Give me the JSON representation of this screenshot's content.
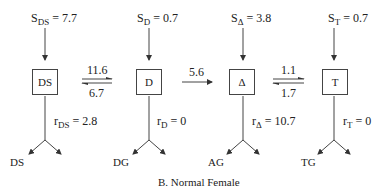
{
  "caption": "B. Normal Female",
  "compartments": [
    {
      "id": "DS",
      "label": "DS",
      "source": {
        "symbol": "S",
        "subscript": "DS",
        "value": "= 7.7"
      },
      "removal": {
        "symbol": "r",
        "subscript": "DS",
        "value": "= 2.8"
      },
      "output": "DS"
    },
    {
      "id": "D",
      "label": "D",
      "source": {
        "symbol": "S",
        "subscript": "D",
        "value": "= 0.7"
      },
      "removal": {
        "symbol": "r",
        "subscript": "D",
        "value": "= 0"
      },
      "output": "DG"
    },
    {
      "id": "Delta",
      "label": "Δ",
      "source": {
        "symbol": "S",
        "subscript": "Δ",
        "value": "= 3.8"
      },
      "removal": {
        "symbol": "r",
        "subscript": "Δ",
        "value": "= 10.7"
      },
      "output": "AG"
    },
    {
      "id": "T",
      "label": "T",
      "source": {
        "symbol": "S",
        "subscript": "T",
        "value": "= 0.7"
      },
      "removal": {
        "symbol": "r",
        "subscript": "T",
        "value": "= 0"
      },
      "output": "TG"
    }
  ],
  "transfers": {
    "ds_to_d": "11.6",
    "d_to_ds": "6.7",
    "d_to_delta": "5.6",
    "delta_to_t": "1.1",
    "t_to_delta": "1.7"
  }
}
